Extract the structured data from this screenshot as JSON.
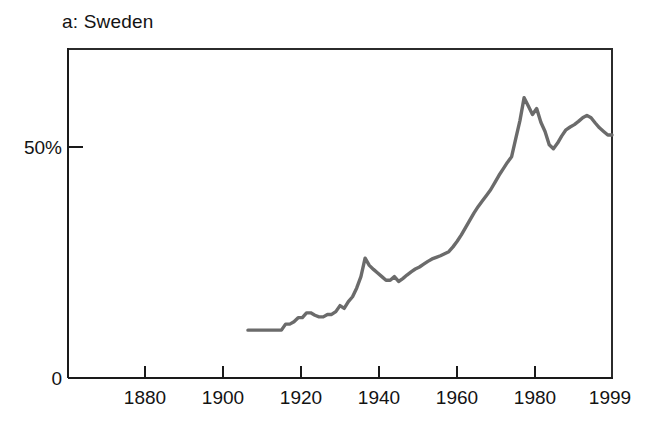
{
  "figure": {
    "panel_label": "a: Sweden",
    "background_color": "#ffffff"
  },
  "chart_data": {
    "type": "line",
    "title": "a: Sweden",
    "xlabel": "",
    "ylabel": "",
    "line_color": "#6b6b6b",
    "axis_color": "#1a1a1a",
    "grid": false,
    "legend": null,
    "xlim": [
      1869,
      1999
    ],
    "ylim": [
      0,
      81.8
    ],
    "xticks": [
      1880,
      1900,
      1920,
      1940,
      1960,
      1980,
      1999
    ],
    "xticklabels": [
      "1880",
      "1900",
      "1920",
      "1940",
      "1960",
      "1980",
      "1999"
    ],
    "yticks": [
      0,
      50
    ],
    "yticklabels": [
      "0",
      "50%"
    ],
    "series": [
      {
        "name": "Sweden",
        "x": [
          1912,
          1913,
          1914,
          1915,
          1916,
          1917,
          1918,
          1919,
          1920,
          1921,
          1922,
          1923,
          1924,
          1925,
          1926,
          1927,
          1928,
          1929,
          1930,
          1931,
          1932,
          1933,
          1934,
          1935,
          1936,
          1937,
          1938,
          1939,
          1940,
          1941,
          1942,
          1943,
          1944,
          1945,
          1946,
          1947,
          1948,
          1949,
          1950,
          1951,
          1952,
          1953,
          1954,
          1955,
          1956,
          1957,
          1958,
          1959,
          1960,
          1961,
          1962,
          1963,
          1964,
          1965,
          1966,
          1967,
          1968,
          1969,
          1970,
          1971,
          1972,
          1973,
          1974,
          1975,
          1976,
          1977,
          1978,
          1979,
          1980,
          1981,
          1982,
          1983,
          1984,
          1985,
          1986,
          1987,
          1988,
          1989,
          1990,
          1991,
          1992,
          1993,
          1994,
          1995,
          1996,
          1997,
          1998,
          1999
        ],
        "y": [
          11.9,
          11.9,
          11.9,
          11.9,
          11.9,
          11.9,
          11.9,
          11.9,
          11.9,
          13.4,
          13.4,
          14.0,
          15.0,
          15.0,
          16.2,
          16.2,
          15.6,
          15.2,
          15.2,
          15.8,
          15.8,
          16.5,
          18.0,
          17.3,
          19.0,
          20.2,
          22.4,
          25.2,
          29.8,
          28.0,
          27.0,
          26.1,
          25.2,
          24.3,
          24.3,
          25.2,
          24.0,
          24.7,
          25.6,
          26.4,
          27.1,
          27.6,
          28.3,
          29.0,
          29.6,
          30.0,
          30.4,
          30.9,
          31.4,
          32.6,
          34.0,
          35.6,
          37.4,
          39.2,
          41.0,
          42.6,
          44.0,
          45.4,
          46.8,
          48.6,
          50.4,
          52.0,
          53.6,
          55.0,
          59.5,
          64.0,
          69.7,
          67.6,
          65.5,
          67.0,
          63.6,
          61.3,
          58.0,
          57.0,
          58.4,
          60.2,
          61.7,
          62.4,
          63.0,
          63.8,
          64.7,
          65.3,
          64.7,
          63.4,
          62.2,
          61.3,
          60.4,
          60.4
        ],
        "description": "Share rising from about 12% in the 1910s to a peak near 70% in the late 1970s, then easing to roughly 60% by 1999."
      }
    ],
    "annotations": []
  }
}
